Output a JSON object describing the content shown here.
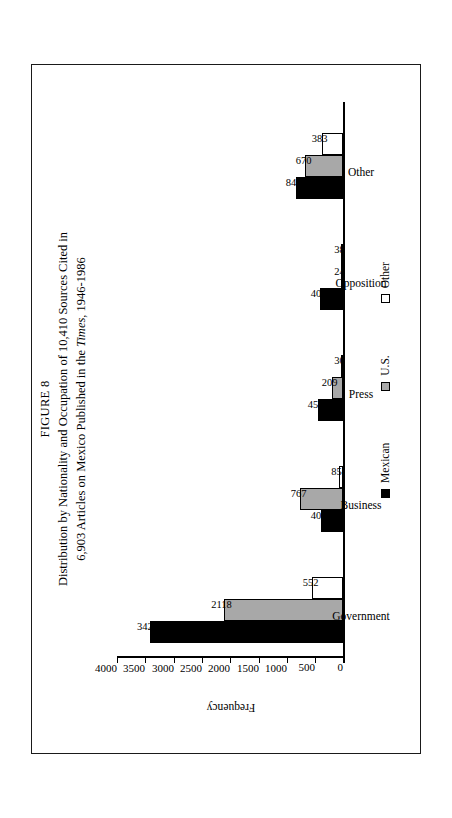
{
  "figure": {
    "number": "FIGURE 8",
    "title_line1_a": "Distribution by Nationality and Occupation of 10,410 Sources Cited in",
    "title_line2_a": "6,903 Articles on Mexico Published in the ",
    "title_line2_italic": "Times",
    "title_line2_b": ", 1946-1986"
  },
  "chart_data": {
    "type": "bar",
    "title": "Distribution by Nationality and Occupation of 10,410 Sources Cited in 6,903 Articles on Mexico Published in the Times, 1946-1986",
    "xlabel": "",
    "ylabel": "Frequency",
    "ylim": [
      0,
      4000
    ],
    "yticks": [
      0,
      500,
      1000,
      1500,
      2000,
      2500,
      3000,
      3500,
      4000
    ],
    "ytick_labels": [
      "0",
      "500",
      "1000",
      "1500",
      "2000",
      "2500",
      "3000",
      "3500",
      "4000"
    ],
    "grid": false,
    "legend_position": "bottom",
    "orientation": "vertical",
    "rotated_page": true,
    "categories": [
      "Government",
      "Business",
      "Press",
      "Opposition",
      "Other"
    ],
    "series": [
      {
        "name": "Mexican",
        "color": "#000000",
        "values": [
          3426,
          402,
          457,
          405,
          845
        ]
      },
      {
        "name": "U.S.",
        "color": "#a8a8a8",
        "values": [
          2118,
          767,
          209,
          24,
          670
        ]
      },
      {
        "name": "Other",
        "color": "#ffffff",
        "values": [
          552,
          85,
          30,
          38,
          383
        ]
      }
    ]
  },
  "axis": {
    "y_title": "Frequency",
    "ticks": [
      "4000",
      "3500",
      "3000",
      "2500",
      "2000",
      "1500",
      "1000",
      "500",
      "0"
    ]
  },
  "legend": {
    "items": [
      {
        "label": "Mexican",
        "swatch": "filled-black-square"
      },
      {
        "label": "U.S.",
        "swatch": "filled-gray-square"
      },
      {
        "label": "Other",
        "swatch": "open-white-square"
      }
    ]
  },
  "groups": [
    {
      "label": "Government",
      "bars": [
        {
          "series": "Mexican",
          "value": "3426"
        },
        {
          "series": "U.S.",
          "value": "2118"
        },
        {
          "series": "Other",
          "value": "552"
        }
      ]
    },
    {
      "label": "Business",
      "bars": [
        {
          "series": "Mexican",
          "value": "402"
        },
        {
          "series": "U.S.",
          "value": "767"
        },
        {
          "series": "Other",
          "value": "85"
        }
      ]
    },
    {
      "label": "Press",
      "bars": [
        {
          "series": "Mexican",
          "value": "457"
        },
        {
          "series": "U.S.",
          "value": "209"
        },
        {
          "series": "Other",
          "value": "30"
        }
      ]
    },
    {
      "label": "Opposition",
      "bars": [
        {
          "series": "Mexican",
          "value": "405"
        },
        {
          "series": "U.S.",
          "value": "24"
        },
        {
          "series": "Other",
          "value": "38"
        }
      ]
    },
    {
      "label": "Other",
      "bars": [
        {
          "series": "Mexican",
          "value": "845"
        },
        {
          "series": "U.S.",
          "value": "670"
        },
        {
          "series": "Other",
          "value": "383"
        }
      ]
    }
  ]
}
